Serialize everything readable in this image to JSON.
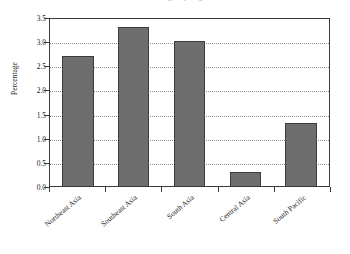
{
  "chart_data": {
    "type": "bar",
    "title": "Percentage by region",
    "subtitle": "",
    "xlabel": "",
    "ylabel": "Percentage",
    "categories": [
      "Northeast Asia",
      "Southeast Asia",
      "South Asia",
      "Central Asia",
      "South Pacific"
    ],
    "values": [
      2.7,
      3.3,
      3.0,
      0.3,
      1.3
    ],
    "ylim": [
      0.0,
      3.5
    ],
    "ytick_values": [
      0.0,
      0.5,
      1.0,
      1.5,
      2.0,
      2.5,
      3.0,
      3.5
    ],
    "ytick_labels": [
      "0.0",
      "0.5",
      "1.0",
      "1.5",
      "2.0",
      "2.5",
      "3.0",
      "3.5"
    ],
    "grid": true,
    "grid_axis": "y",
    "grid_style": "dotted",
    "legend": false,
    "legend_position": "none",
    "orientation": "vertical",
    "series": [
      {
        "name": "Percentage",
        "values": [
          2.7,
          3.3,
          3.0,
          0.3,
          1.3
        ]
      }
    ]
  },
  "colors": {
    "bar_fill": "#6e6e6e",
    "bar_edge": "#3c3c3c",
    "plot_border": "#3a3a3a",
    "grid": "#8d8d8d",
    "text": "#1a1a1a",
    "background": "#ffffff",
    "title_faded": "#b8b8b8"
  }
}
